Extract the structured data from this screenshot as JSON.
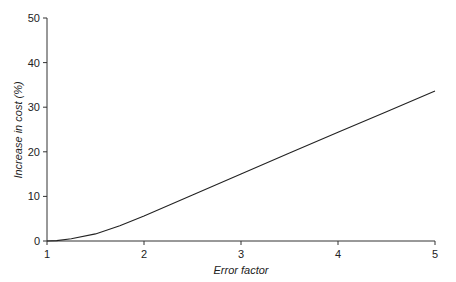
{
  "chart_data": {
    "type": "line",
    "title": "",
    "xlabel": "Error factor",
    "ylabel": "Increase in cost (%)",
    "xlim": [
      1,
      5
    ],
    "ylim": [
      0,
      50
    ],
    "x_ticks": [
      1,
      2,
      3,
      4,
      5
    ],
    "y_ticks": [
      0,
      10,
      20,
      30,
      40,
      50
    ],
    "grid": false,
    "legend": null,
    "series": [
      {
        "name": "Increase in cost",
        "color": "#222222",
        "x": [
          1.0,
          1.1,
          1.25,
          1.5,
          1.75,
          2.0,
          2.5,
          3.0,
          3.5,
          4.0,
          4.5,
          5.0
        ],
        "y": [
          0.0,
          0.1,
          0.5,
          1.6,
          3.4,
          5.6,
          10.3,
          15.0,
          19.7,
          24.4,
          29.0,
          33.6
        ]
      }
    ]
  },
  "axes": {
    "x_title": "Error factor",
    "y_title": "Increase in cost (%)",
    "x_tick_labels": [
      "1",
      "2",
      "3",
      "4",
      "5"
    ],
    "y_tick_labels": [
      "0",
      "10",
      "20",
      "30",
      "40",
      "50"
    ]
  }
}
